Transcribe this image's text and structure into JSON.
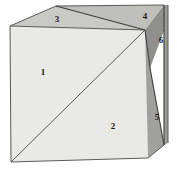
{
  "figure": {
    "background_color": "#ffffff",
    "labels": [
      {
        "id": "face-1",
        "text": "1",
        "x": 43,
        "y": 73,
        "face": "front-upper-left"
      },
      {
        "id": "face-2",
        "text": "2",
        "x": 113,
        "y": 127,
        "face": "front-lower-right"
      },
      {
        "id": "face-3",
        "text": "3",
        "x": 57,
        "y": 20,
        "face": "top-left"
      },
      {
        "id": "face-4",
        "text": "4",
        "x": 145,
        "y": 17,
        "face": "top-right"
      },
      {
        "id": "face-5",
        "text": "5",
        "x": 157,
        "y": 118,
        "face": "right-lower"
      },
      {
        "id": "face-6",
        "text": "6",
        "x": 161,
        "y": 41,
        "face": "right-upper"
      }
    ],
    "faces": [
      {
        "id": "front-face",
        "name": "front-face",
        "fill": "#e9e9e6",
        "points": "10,26 145,30 148,158 11,162"
      },
      {
        "id": "top-left-face",
        "name": "top-left-face",
        "fill": "#c9c9c6",
        "points": "10,26 56,6 145,30"
      },
      {
        "id": "top-right-face",
        "name": "top-right-face",
        "fill": "#bfbfbc",
        "points": "56,6 164,5 145,30"
      },
      {
        "id": "right-upper-face",
        "name": "right-upper-face",
        "fill": "#8f8f8c",
        "points": "145,30 164,5 165,28 150,68"
      },
      {
        "id": "right-lower-face",
        "name": "right-lower-face",
        "fill": "#a0a09d",
        "points": "145,30 150,68 164,145 148,158"
      },
      {
        "id": "right-edge-strip",
        "name": "right-edge-strip",
        "fill": "#9a9a97",
        "points": "164,5 168,5 168,143 164,145"
      }
    ],
    "edges": [
      {
        "id": "front-diagonal",
        "name": "front-diagonal-edge",
        "d": "M 11,162 L 145,30"
      },
      {
        "id": "front-left",
        "name": "front-left-edge",
        "d": "M 10,26 L 11,162"
      },
      {
        "id": "front-bottom",
        "name": "front-bottom-edge",
        "d": "M 11,162 L 148,158"
      },
      {
        "id": "front-top",
        "name": "front-top-edge",
        "d": "M 10,26 L 145,30"
      },
      {
        "id": "top-ridge-left",
        "name": "top-ridge-left-edge",
        "d": "M 10,26 L 56,6"
      },
      {
        "id": "top-ridge-right",
        "name": "top-ridge-right-edge",
        "d": "M 56,6 L 164,5"
      },
      {
        "id": "top-fold",
        "name": "top-fold-edge",
        "d": "M 56,6 L 145,30"
      },
      {
        "id": "right-vertical",
        "name": "right-vertical-edge",
        "d": "M 164,5 L 164,145"
      },
      {
        "id": "right-back-edge",
        "name": "right-back-outer-edge",
        "d": "M 168,5 L 168,143"
      },
      {
        "id": "right-diagonal",
        "name": "right-diagonal-edge",
        "d": "M 145,30 L 150,68 L 164,145"
      },
      {
        "id": "right-bottom",
        "name": "right-bottom-edge",
        "d": "M 148,158 L 164,145"
      },
      {
        "id": "right-corner",
        "name": "right-corner-edge",
        "d": "M 145,30 L 164,28"
      }
    ]
  }
}
